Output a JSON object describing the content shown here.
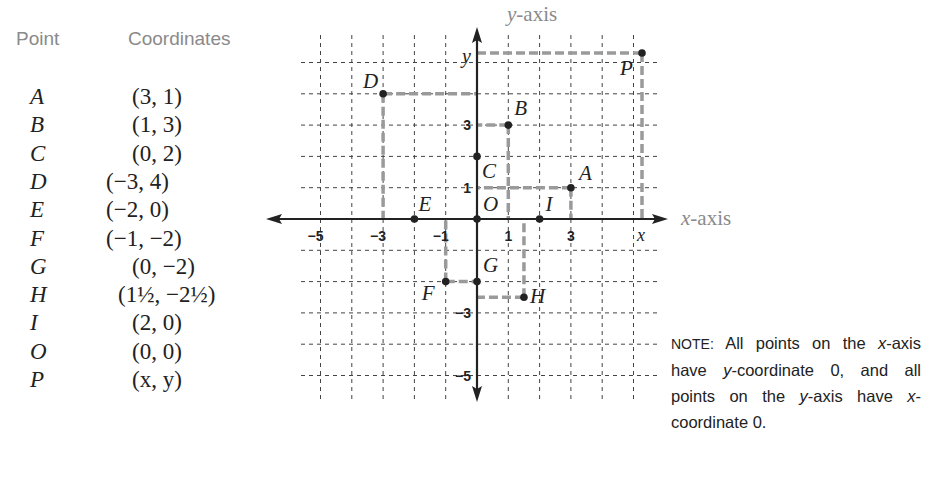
{
  "table": {
    "header_point": "Point",
    "header_coordinates": "Coordinates",
    "rows": [
      {
        "point": "A",
        "coords": "(3,  1)",
        "offset": 132
      },
      {
        "point": "B",
        "coords": "(1,  3)",
        "offset": 132
      },
      {
        "point": "C",
        "coords": "(0,  2)",
        "offset": 132
      },
      {
        "point": "D",
        "coords": "(−3,  4)",
        "offset": 106
      },
      {
        "point": "E",
        "coords": "(−2,  0)",
        "offset": 106
      },
      {
        "point": "F",
        "coords": "(−1,  −2)",
        "offset": 106
      },
      {
        "point": "G",
        "coords": "(0,  −2)",
        "offset": 132
      },
      {
        "point": "H",
        "coords": "(1½,  −2½)",
        "offset": 118
      },
      {
        "point": "I",
        "coords": "(2,  0)",
        "offset": 132
      },
      {
        "point": "O",
        "coords": "(0,  0)",
        "offset": 132
      },
      {
        "point": "P",
        "coords": "(x,  y)",
        "offset": 132
      }
    ]
  },
  "axes": {
    "x_caption_var": "x",
    "x_caption_rest": "-axis",
    "y_caption_var": "y",
    "y_caption_rest": "-axis",
    "x_tick_labels": [
      {
        "value": -5,
        "text": "−5"
      },
      {
        "value": -3,
        "text": "−3"
      },
      {
        "value": -1,
        "text": "−1"
      },
      {
        "value": 1,
        "text": "1"
      },
      {
        "value": 3,
        "text": "3"
      }
    ],
    "y_tick_labels": [
      {
        "value": 3,
        "text": "3"
      },
      {
        "value": 1,
        "text": "1"
      },
      {
        "value": -3,
        "text": "−3"
      },
      {
        "value": -5,
        "text": "−5"
      }
    ],
    "x_var_label": "x",
    "y_var_label": "y"
  },
  "chart_data": {
    "type": "scatter",
    "title": "",
    "xlabel": "x-axis",
    "ylabel": "y-axis",
    "xlim": [
      -6,
      6
    ],
    "ylim": [
      -6,
      6
    ],
    "grid": true,
    "points": [
      {
        "label": "A",
        "x": 3,
        "y": 1
      },
      {
        "label": "B",
        "x": 1,
        "y": 3
      },
      {
        "label": "C",
        "x": 0,
        "y": 2
      },
      {
        "label": "D",
        "x": -3,
        "y": 4
      },
      {
        "label": "E",
        "x": -2,
        "y": 0
      },
      {
        "label": "F",
        "x": -1,
        "y": -2
      },
      {
        "label": "G",
        "x": 0,
        "y": -2
      },
      {
        "label": "H",
        "x": 1.5,
        "y": -2.5
      },
      {
        "label": "I",
        "x": 2,
        "y": 0
      },
      {
        "label": "O",
        "x": 0,
        "y": 0
      },
      {
        "label": "P",
        "x": "x",
        "y": "y"
      }
    ]
  },
  "note": {
    "label": "NOTE:",
    "text_parts": [
      "All points on the ",
      "x",
      "-axis have ",
      "y",
      "-coordinate 0, and all points on the ",
      "y",
      "-axis have ",
      "x",
      "-coordinate 0."
    ]
  },
  "colors": {
    "ink": "#222222",
    "grid": "#444444",
    "projection": "#9a9a9a",
    "caption": "#8a8a8a"
  }
}
